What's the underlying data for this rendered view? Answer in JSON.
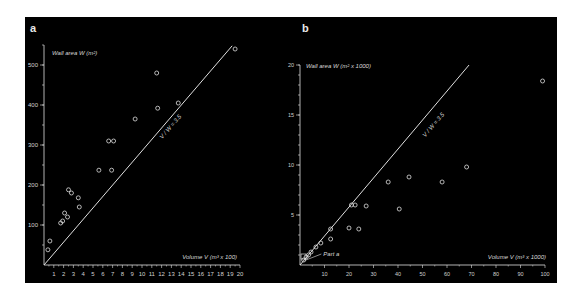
{
  "panels": {
    "a": {
      "label": "a"
    },
    "b": {
      "label": "b"
    }
  },
  "colors": {
    "background": "#000000",
    "foreground": "#e0e0e0",
    "page": "#ffffff"
  },
  "chart_data": [
    {
      "panel": "a",
      "type": "scatter",
      "title": "",
      "xlabel": "Volume V (m³ x 100)",
      "ylabel": "Wall area W (m²)",
      "xlim": [
        0,
        20
      ],
      "ylim": [
        0,
        550
      ],
      "x_ticks": [
        1,
        2,
        3,
        4,
        5,
        6,
        7,
        8,
        9,
        10,
        11,
        12,
        13,
        14,
        15,
        16,
        17,
        18,
        19,
        20
      ],
      "y_ticks": [
        100,
        200,
        300,
        400,
        500
      ],
      "grid": false,
      "reference_line": {
        "label": "V / W = 3.5",
        "x": [
          0,
          19.2
        ],
        "y": [
          0,
          548
        ]
      },
      "series": [
        {
          "name": "rooms",
          "marker": "open-circle",
          "points": [
            [
              0.4,
              38
            ],
            [
              0.6,
              60
            ],
            [
              1.7,
              105
            ],
            [
              1.9,
              110
            ],
            [
              2.1,
              130
            ],
            [
              2.4,
              120
            ],
            [
              2.5,
              188
            ],
            [
              2.8,
              180
            ],
            [
              3.5,
              168
            ],
            [
              3.6,
              145
            ],
            [
              5.6,
              237
            ],
            [
              6.6,
              310
            ],
            [
              6.9,
              237
            ],
            [
              7.1,
              310
            ],
            [
              9.3,
              365
            ],
            [
              11.5,
              480
            ],
            [
              11.6,
              392
            ],
            [
              13.7,
              405
            ],
            [
              19.5,
              540
            ]
          ]
        }
      ]
    },
    {
      "panel": "b",
      "type": "scatter",
      "title": "",
      "xlabel": "Volume V (m³ x 1000)",
      "ylabel": "Wall area W (m² x 1000)",
      "xlim": [
        0,
        100
      ],
      "ylim": [
        0,
        20
      ],
      "x_ticks": [
        10,
        20,
        30,
        40,
        50,
        60,
        70,
        80,
        90,
        100
      ],
      "y_ticks": [
        5,
        10,
        15,
        20
      ],
      "grid": false,
      "reference_line": {
        "label": "V / W = 3.5",
        "x": [
          0,
          69
        ],
        "y": [
          0,
          20
        ]
      },
      "annotation": {
        "text": "Part a",
        "x": 3,
        "y": 1
      },
      "series": [
        {
          "name": "buildings",
          "marker": "open-circle",
          "points": [
            [
              1.5,
              0.5
            ],
            [
              2.5,
              0.8
            ],
            [
              3.5,
              1.0
            ],
            [
              4.5,
              1.3
            ],
            [
              6.5,
              1.8
            ],
            [
              8.5,
              2.2
            ],
            [
              12.5,
              2.6
            ],
            [
              12.5,
              3.6
            ],
            [
              20,
              3.7
            ],
            [
              21,
              6.0
            ],
            [
              22.5,
              6.0
            ],
            [
              24,
              3.6
            ],
            [
              27,
              5.9
            ],
            [
              36,
              8.3
            ],
            [
              40.5,
              5.6
            ],
            [
              44.5,
              8.8
            ],
            [
              58,
              8.3
            ],
            [
              68,
              9.8
            ],
            [
              99,
              18.4
            ]
          ]
        }
      ]
    }
  ]
}
